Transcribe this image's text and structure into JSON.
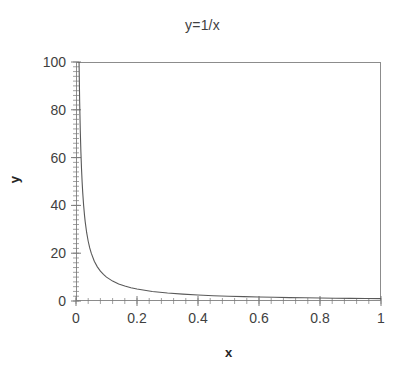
{
  "chart_data": {
    "type": "line",
    "title": "y=1/x",
    "xlabel": "x",
    "ylabel": "y",
    "xlim": [
      0,
      1
    ],
    "ylim": [
      0,
      100
    ],
    "grid": false,
    "legend": null,
    "x_major_ticks": [
      "0",
      "0.2",
      "0.4",
      "0.6",
      "0.8",
      "1"
    ],
    "x_major_values": [
      0,
      0.2,
      0.4,
      0.6,
      0.8,
      1
    ],
    "x_minor_step": 0.04,
    "y_major_ticks": [
      "0",
      "20",
      "40",
      "60",
      "80",
      "100"
    ],
    "y_major_values": [
      0,
      20,
      40,
      60,
      80,
      100
    ],
    "y_minor_step": 2,
    "series": [
      {
        "name": "y=1/x",
        "color": "#595959",
        "x": [
          0.01,
          0.012,
          0.014,
          0.016,
          0.018,
          0.02,
          0.022,
          0.025,
          0.028,
          0.03,
          0.035,
          0.04,
          0.045,
          0.05,
          0.06,
          0.07,
          0.08,
          0.09,
          0.1,
          0.12,
          0.14,
          0.16,
          0.18,
          0.2,
          0.25,
          0.3,
          0.35,
          0.4,
          0.45,
          0.5,
          0.55,
          0.6,
          0.65,
          0.7,
          0.75,
          0.8,
          0.85,
          0.9,
          0.95,
          1.0
        ],
        "y": [
          100,
          83.33,
          71.43,
          62.5,
          55.56,
          50,
          45.45,
          40,
          35.71,
          33.33,
          28.57,
          25,
          22.22,
          20,
          16.67,
          14.29,
          12.5,
          11.11,
          10,
          8.33,
          7.14,
          6.25,
          5.56,
          5,
          4,
          3.33,
          2.86,
          2.5,
          2.22,
          2,
          1.82,
          1.67,
          1.54,
          1.43,
          1.33,
          1.25,
          1.18,
          1.11,
          1.05,
          1.0
        ]
      }
    ]
  },
  "axis_colors": {
    "frame": "#8c8c8c",
    "tick": "#7a7a7a",
    "curve": "#595959",
    "text": "#3f3f3f"
  }
}
